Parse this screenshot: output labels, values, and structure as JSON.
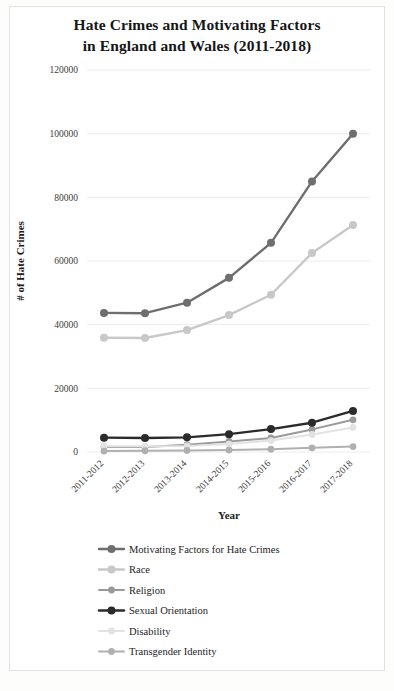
{
  "chart_data": {
    "type": "line",
    "title": "Hate Crimes and Motivating Factors in England and Wales (2011-2018)",
    "title_line1": "Hate Crimes and Motivating Factors",
    "title_line2": "in England and Wales (2011-2018)",
    "xlabel": "Year",
    "ylabel": "# of Hate Crimes",
    "categories": [
      "2011-2012",
      "2012-2013",
      "2013-2014",
      "2014-2015",
      "2015-2016",
      "2016-2017",
      "2017-2018"
    ],
    "ylim": [
      0,
      120000
    ],
    "ytick_labels": [
      "0",
      "20000",
      "40000",
      "60000",
      "80000",
      "100000",
      "120000"
    ],
    "ytick_values": [
      0,
      20000,
      40000,
      60000,
      80000,
      100000,
      120000
    ],
    "grid": true,
    "legend_position": "bottom",
    "series": [
      {
        "name": "Motivating Factors for Hate Crimes",
        "color": "#6e6e6e",
        "width": 2.4,
        "marker": 4.0,
        "values": [
          43700,
          43600,
          46900,
          54700,
          65700,
          85000,
          100000
        ]
      },
      {
        "name": "Race",
        "color": "#c8c8c8",
        "width": 2.4,
        "marker": 4.0,
        "values": [
          35900,
          35800,
          38300,
          43000,
          49400,
          62500,
          71300
        ]
      },
      {
        "name": "Religion",
        "color": "#9a9a9a",
        "width": 2.0,
        "marker": 3.4,
        "values": [
          1600,
          1600,
          2300,
          3300,
          4400,
          7100,
          10100
        ]
      },
      {
        "name": "Sexual Orientation",
        "color": "#2b2b2b",
        "width": 2.4,
        "marker": 4.0,
        "values": [
          4500,
          4400,
          4600,
          5600,
          7200,
          9200,
          12900
        ]
      },
      {
        "name": "Disability",
        "color": "#e2e2e2",
        "width": 2.0,
        "marker": 3.4,
        "values": [
          1800,
          1800,
          1900,
          2500,
          3600,
          5500,
          7700
        ]
      },
      {
        "name": "Transgender Identity",
        "color": "#b0b0b0",
        "width": 2.0,
        "marker": 3.4,
        "values": [
          300,
          400,
          500,
          600,
          900,
          1300,
          1700
        ]
      }
    ]
  },
  "layout": {
    "plot_left": 87,
    "plot_right": 370,
    "plot_top": 70,
    "plot_bottom": 452,
    "x_positions": [
      104,
      145,
      187,
      229,
      271,
      312,
      353
    ],
    "legend_x_line_start": 99,
    "legend_x_line_end": 124,
    "legend_x_text": 129,
    "legend_y_start": 549,
    "legend_y_step": 20.5,
    "xlabel_x": 229,
    "xlabel_y": 519,
    "ylabel_x": 24,
    "ylabel_y": 261
  }
}
